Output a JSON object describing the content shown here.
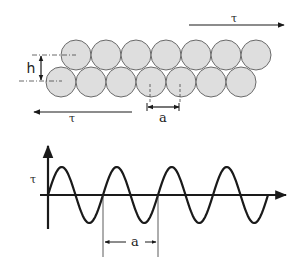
{
  "colors": {
    "circle_fill": "#dedede",
    "circle_stroke": "#6a6a6a",
    "line": "#1a1a1a",
    "background": "#ffffff"
  },
  "top_panel": {
    "title": "Two layers of close-packed atoms sheared by stress",
    "labels": {
      "shear_top": "τ",
      "shear_bottom": "τ",
      "layer_spacing": "h",
      "atom_spacing": "a"
    },
    "top_row": {
      "count": 7,
      "centers_x": [
        76,
        106,
        136,
        166,
        196,
        226,
        256
      ],
      "center_y": 55,
      "radius": 15
    },
    "bottom_row": {
      "count": 7,
      "centers_x": [
        61,
        91,
        121,
        151,
        181,
        211,
        241
      ],
      "center_y": 82,
      "radius": 15
    }
  },
  "bottom_panel": {
    "labels": {
      "y_axis": "τ",
      "period": "a"
    },
    "wave": {
      "type": "sine",
      "x_start": 48,
      "x_end": 268,
      "baseline_y": 195,
      "amplitude": 28,
      "period_px": 55,
      "cycles": 4
    }
  }
}
